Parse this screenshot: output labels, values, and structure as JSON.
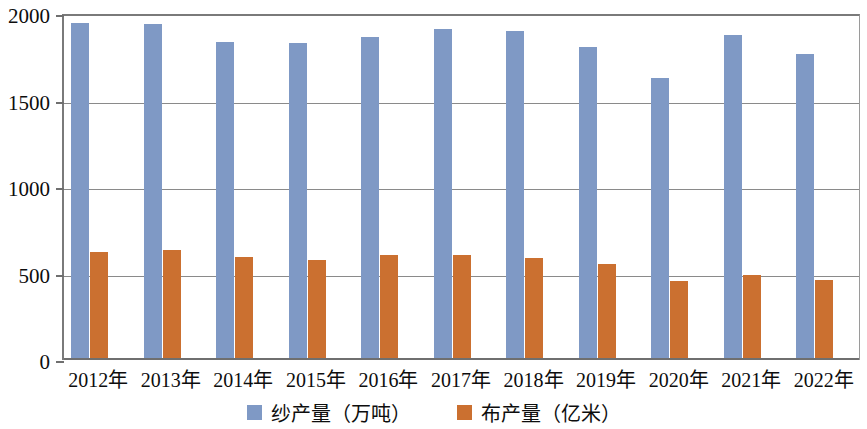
{
  "chart_data": {
    "type": "bar",
    "title": "",
    "xlabel": "",
    "ylabel": "",
    "ylim": [
      0,
      2000
    ],
    "yticks": [
      0,
      500,
      1000,
      1500,
      2000
    ],
    "grid": true,
    "legend_position": "bottom",
    "categories": [
      "2012年",
      "2013年",
      "2014年",
      "2015年",
      "2016年",
      "2017年",
      "2018年",
      "2019年",
      "2020年",
      "2021年",
      "2022年"
    ],
    "series": [
      {
        "name": "纱产量（万吨）",
        "color": "#7f99c5",
        "values": [
          1950,
          1940,
          1840,
          1835,
          1870,
          1915,
          1900,
          1810,
          1630,
          1880,
          1770
        ]
      },
      {
        "name": "布产量（亿米）",
        "color": "#cb7030",
        "values": [
          625,
          635,
          595,
          580,
          605,
          605,
          590,
          555,
          455,
          490,
          460
        ]
      }
    ]
  },
  "axis": {
    "y_tick_labels": [
      "2000",
      "1500",
      "1000",
      "500",
      "0"
    ]
  },
  "legend": {
    "items": [
      {
        "label": "纱产量（万吨）",
        "color": "#7f99c5",
        "swatch_name": "legend-swatch-yarn"
      },
      {
        "label": "布产量（亿米）",
        "color": "#cb7030",
        "swatch_name": "legend-swatch-cloth"
      }
    ]
  }
}
